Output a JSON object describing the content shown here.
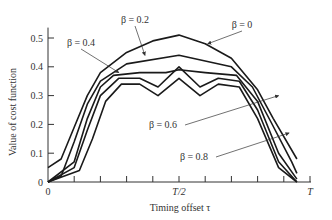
{
  "chart_data": {
    "type": "line",
    "title": "",
    "xlabel": "Timing offset τ",
    "ylabel": "Value of cost function",
    "xlim": [
      0,
      1
    ],
    "ylim": [
      0,
      0.55
    ],
    "grid": false,
    "x_ticks": [
      {
        "pos": 0,
        "label": "0"
      },
      {
        "pos": 0.1,
        "label": ""
      },
      {
        "pos": 0.2,
        "label": ""
      },
      {
        "pos": 0.3,
        "label": ""
      },
      {
        "pos": 0.4,
        "label": ""
      },
      {
        "pos": 0.5,
        "label": "T/2"
      },
      {
        "pos": 0.6,
        "label": ""
      },
      {
        "pos": 0.7,
        "label": ""
      },
      {
        "pos": 0.8,
        "label": ""
      },
      {
        "pos": 0.9,
        "label": ""
      },
      {
        "pos": 1.0,
        "label": "T"
      }
    ],
    "y_ticks": [
      {
        "val": 0,
        "label": "0"
      },
      {
        "val": 0.1,
        "label": "0.1"
      },
      {
        "val": 0.2,
        "label": "0.2"
      },
      {
        "val": 0.3,
        "label": "0.3"
      },
      {
        "val": 0.4,
        "label": "0.4"
      },
      {
        "val": 0.5,
        "label": "0.5"
      }
    ],
    "x_unit_note": "x expressed as fraction of T",
    "series": [
      {
        "name": "β = 0",
        "x": [
          0,
          0.05,
          0.1,
          0.15,
          0.2,
          0.3,
          0.4,
          0.5,
          0.6,
          0.7,
          0.8,
          0.86,
          0.95
        ],
        "y": [
          0.05,
          0.08,
          0.19,
          0.3,
          0.38,
          0.45,
          0.49,
          0.51,
          0.48,
          0.43,
          0.32,
          0.22,
          0.08
        ]
      },
      {
        "name": "β = 0.2",
        "x": [
          0,
          0.05,
          0.1,
          0.15,
          0.2,
          0.3,
          0.5,
          0.7,
          0.78,
          0.85,
          0.93,
          0.95
        ],
        "y": [
          0,
          0.02,
          0.14,
          0.27,
          0.35,
          0.41,
          0.44,
          0.4,
          0.33,
          0.21,
          0.07,
          0.03
        ]
      },
      {
        "name": "β = 0.4",
        "x": [
          0,
          0.1,
          0.15,
          0.2,
          0.25,
          0.35,
          0.45,
          0.5,
          0.6,
          0.72,
          0.8,
          0.88,
          0.95
        ],
        "y": [
          0,
          0.07,
          0.22,
          0.33,
          0.37,
          0.38,
          0.38,
          0.39,
          0.38,
          0.37,
          0.28,
          0.1,
          0.01
        ]
      },
      {
        "name": "β = 0.6",
        "x": [
          0,
          0.1,
          0.15,
          0.2,
          0.27,
          0.35,
          0.42,
          0.5,
          0.58,
          0.65,
          0.73,
          0.8,
          0.88,
          0.95
        ],
        "y": [
          0,
          0.05,
          0.18,
          0.3,
          0.36,
          0.36,
          0.33,
          0.4,
          0.33,
          0.36,
          0.35,
          0.25,
          0.07,
          0
        ]
      },
      {
        "name": "β = 0.8",
        "x": [
          0,
          0.12,
          0.17,
          0.22,
          0.28,
          0.35,
          0.42,
          0.5,
          0.58,
          0.65,
          0.73,
          0.8,
          0.88,
          0.95
        ],
        "y": [
          0,
          0.04,
          0.15,
          0.28,
          0.34,
          0.34,
          0.3,
          0.36,
          0.3,
          0.34,
          0.33,
          0.22,
          0.05,
          0
        ]
      }
    ],
    "annotations": [
      {
        "text": "β = 0",
        "label_x": 242,
        "label_y": 28,
        "arrow_to": [
          0.61,
          0.48
        ]
      },
      {
        "text": "β = 0.2",
        "label_x": 135,
        "label_y": 23,
        "arrow_to": [
          0.37,
          0.44
        ]
      },
      {
        "text": "β = 0.4",
        "label_x": 81,
        "label_y": 46,
        "arrow_to": [
          0.27,
          0.38
        ]
      },
      {
        "text": "β = 0.6",
        "label_x": 163,
        "label_y": 128,
        "arrow_to": [
          0.88,
          0.3
        ]
      },
      {
        "text": "β = 0.8",
        "label_x": 194,
        "label_y": 160,
        "arrow_to": [
          0.92,
          0.17
        ]
      }
    ]
  }
}
